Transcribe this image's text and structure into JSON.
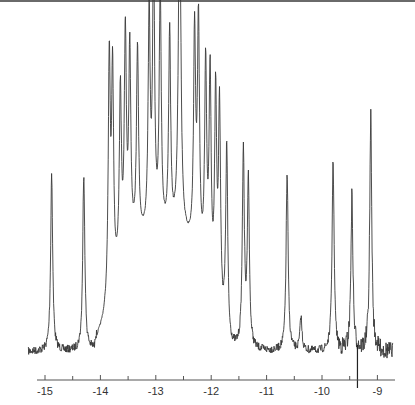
{
  "chart_data": {
    "type": "line",
    "title": "",
    "xlabel": "",
    "ylabel": "",
    "x_axis": {
      "ticks": [
        -15,
        -14,
        -13,
        -12,
        -11,
        -10,
        -9
      ],
      "tick_labels": [
        "-15",
        "-14",
        "-13",
        "-12",
        "-11",
        "-10",
        "-9"
      ],
      "minor_ticks": [
        -14.5,
        -13.5,
        -12.5,
        -11.5,
        -10.5,
        -9.5
      ],
      "xlim": [
        -15.2,
        -8.6
      ],
      "reversed": false
    },
    "grid": false,
    "legend": null,
    "peaks": [
      {
        "x": -14.88,
        "height": 0.53
      },
      {
        "x": -14.3,
        "height": 0.53
      },
      {
        "x": -13.84,
        "height": 0.72
      },
      {
        "x": -13.78,
        "height": 0.64
      },
      {
        "x": -13.64,
        "height": 0.52
      },
      {
        "x": -13.55,
        "height": 0.65
      },
      {
        "x": -13.47,
        "height": 0.58
      },
      {
        "x": -13.33,
        "height": 0.57
      },
      {
        "x": -13.12,
        "height": 0.65
      },
      {
        "x": -13.04,
        "height": 0.81
      },
      {
        "x": -12.92,
        "height": 0.72
      },
      {
        "x": -12.75,
        "height": 0.6
      },
      {
        "x": -12.57,
        "height": 1.0
      },
      {
        "x": -12.3,
        "height": 0.64
      },
      {
        "x": -12.23,
        "height": 0.69
      },
      {
        "x": -12.1,
        "height": 0.62
      },
      {
        "x": -12.02,
        "height": 0.63
      },
      {
        "x": -11.92,
        "height": 0.62
      },
      {
        "x": -11.85,
        "height": 0.62
      },
      {
        "x": -11.72,
        "height": 0.56
      },
      {
        "x": -11.42,
        "height": 0.58
      },
      {
        "x": -11.33,
        "height": 0.5
      },
      {
        "x": -10.63,
        "height": 0.53
      },
      {
        "x": -10.38,
        "height": 0.1
      },
      {
        "x": -9.8,
        "height": 0.57
      },
      {
        "x": -9.46,
        "height": 0.46
      },
      {
        "x": -9.12,
        "height": 0.7
      }
    ],
    "baseline": 0.0
  },
  "colors": {
    "trace": "#3a3a3a",
    "axis": "#555555",
    "border": "#6a6a6a",
    "background": "#ffffff"
  }
}
